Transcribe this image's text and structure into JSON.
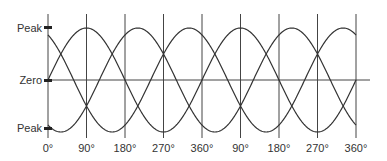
{
  "chart_data": {
    "type": "line",
    "title": "",
    "xlabel": "",
    "ylabel": "",
    "y_tick_labels": [
      "Peak",
      "Zero",
      "Peak"
    ],
    "x_tick_labels": [
      "0°",
      "90°",
      "180°",
      "270°",
      "360°",
      "90°",
      "180°",
      "270°",
      "360°"
    ],
    "x_degrees": [
      0,
      90,
      180,
      270,
      360,
      450,
      540,
      630,
      720
    ],
    "ylim": [
      -1,
      1
    ],
    "grid": {
      "vertical_lines_at_ticks": true,
      "zero_line": true
    },
    "series": [
      {
        "name": "phase-1",
        "formula": "sin(theta)",
        "phase_deg": 0
      },
      {
        "name": "phase-2",
        "formula": "sin(theta + 120)",
        "phase_deg": 120
      },
      {
        "name": "phase-3",
        "formula": "sin(theta + 240)",
        "phase_deg": 240
      }
    ]
  },
  "labels": {
    "peak_top": "Peak",
    "zero": "Zero",
    "peak_bottom": "Peak"
  },
  "colors": {
    "line": "#333333",
    "grid": "#444444"
  }
}
